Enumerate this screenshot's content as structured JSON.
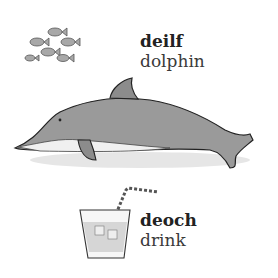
{
  "entries": [
    {
      "irish": "deilf",
      "english": "dolphin",
      "illustration": "dolphin-illustration"
    },
    {
      "irish": "deoch",
      "english": "drink",
      "illustration": "drink-glass-illustration"
    }
  ],
  "decorations": [
    "fish-school-illustration"
  ],
  "colors": {
    "dolphin": "#9a9a9a",
    "dolphin_belly": "#eeeeee",
    "outline": "#222222",
    "liquid": "#d6d6d6",
    "straw_stripe": "#777777"
  }
}
